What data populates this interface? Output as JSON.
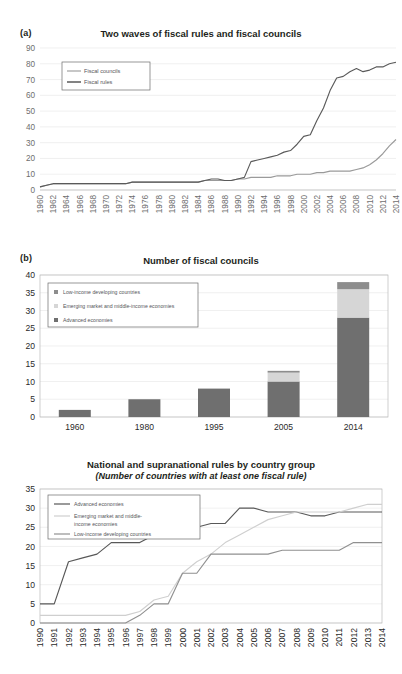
{
  "figure": {
    "panel_a_letter": "(a)",
    "panel_b_letter": "(b)"
  },
  "chart_data": [
    {
      "id": "panel_a",
      "type": "line",
      "title": "Two waves of fiscal rules and fiscal councils",
      "xlabel": "",
      "ylabel": "",
      "ylim": [
        0,
        90
      ],
      "yticks": [
        0,
        10,
        20,
        30,
        40,
        50,
        60,
        70,
        80,
        90
      ],
      "grid": true,
      "legend_position": "top-left",
      "x": [
        1960,
        1961,
        1962,
        1963,
        1964,
        1965,
        1966,
        1967,
        1968,
        1969,
        1970,
        1971,
        1972,
        1973,
        1974,
        1975,
        1976,
        1977,
        1978,
        1979,
        1980,
        1981,
        1982,
        1983,
        1984,
        1985,
        1986,
        1987,
        1988,
        1989,
        1990,
        1991,
        1992,
        1993,
        1994,
        1995,
        1996,
        1997,
        1998,
        1999,
        2000,
        2001,
        2002,
        2003,
        2004,
        2005,
        2006,
        2007,
        2008,
        2009,
        2010,
        2011,
        2012,
        2013,
        2014
      ],
      "xtick_labels": [
        "1960",
        "1962",
        "1964",
        "1966",
        "1968",
        "1970",
        "1972",
        "1974",
        "1976",
        "1978",
        "1980",
        "1982",
        "1984",
        "1986",
        "1988",
        "1990",
        "1992",
        "1994",
        "1996",
        "1998",
        "2000",
        "2002",
        "2004",
        "2006",
        "2008",
        "2010",
        "2012",
        "2014"
      ],
      "series": [
        {
          "name": "Fiscal councils",
          "color": "#9a9a9a",
          "values": [
            2,
            3,
            4,
            4,
            4,
            4,
            4,
            4,
            4,
            4,
            4,
            4,
            4,
            4,
            5,
            5,
            5,
            5,
            5,
            5,
            5,
            5,
            5,
            5,
            5,
            6,
            6,
            6,
            6,
            6,
            7,
            7,
            8,
            8,
            8,
            8,
            9,
            9,
            9,
            10,
            10,
            10,
            11,
            11,
            12,
            12,
            12,
            12,
            13,
            14,
            16,
            19,
            23,
            28,
            32
          ]
        },
        {
          "name": "Fiscal rules",
          "color": "#5a5a5a",
          "values": [
            2,
            3,
            4,
            4,
            4,
            4,
            4,
            4,
            4,
            4,
            4,
            4,
            4,
            4,
            5,
            5,
            5,
            5,
            5,
            5,
            5,
            5,
            5,
            5,
            5,
            6,
            7,
            7,
            6,
            6,
            7,
            8,
            18,
            19,
            20,
            21,
            22,
            24,
            25,
            29,
            34,
            35,
            44,
            52,
            63,
            71,
            72,
            75,
            77,
            75,
            76,
            78,
            78,
            80,
            81
          ]
        }
      ]
    },
    {
      "id": "panel_b",
      "type": "bar",
      "bar_mode": "stacked",
      "title": "Number of fiscal councils",
      "xlabel": "",
      "ylabel": "",
      "ylim": [
        0,
        40
      ],
      "yticks": [
        0,
        5,
        10,
        15,
        20,
        25,
        30,
        35,
        40
      ],
      "grid": true,
      "legend_position": "top-left",
      "categories": [
        "1960",
        "1980",
        "1995",
        "2005",
        "2014"
      ],
      "series": [
        {
          "name": "Low-income developing countries",
          "color": "#8d8d8d",
          "values": [
            0,
            0,
            0,
            0.5,
            2
          ]
        },
        {
          "name": "Emerging market and middle-income economies",
          "color": "#d6d6d6",
          "values": [
            0,
            0,
            0,
            2.5,
            8
          ]
        },
        {
          "name": "Advanced economies",
          "color": "#6f6f6f",
          "values": [
            2,
            5,
            8,
            10,
            28
          ]
        }
      ],
      "stack_order": [
        "Advanced economies",
        "Emerging market and middle-income economies",
        "Low-income developing countries"
      ]
    },
    {
      "id": "panel_c",
      "type": "line",
      "title": "National and supranational rules by country group",
      "subtitle": "(Number of countries with at least one fiscal rule)",
      "xlabel": "",
      "ylabel": "",
      "ylim": [
        0,
        35
      ],
      "yticks": [
        0,
        5,
        10,
        15,
        20,
        25,
        30,
        35
      ],
      "grid": true,
      "legend_position": "top-left",
      "x": [
        1990,
        1991,
        1992,
        1993,
        1994,
        1995,
        1996,
        1997,
        1998,
        1999,
        2000,
        2001,
        2002,
        2003,
        2004,
        2005,
        2006,
        2007,
        2008,
        2009,
        2010,
        2011,
        2012,
        2013,
        2014
      ],
      "xtick_labels": [
        "1990",
        "1991",
        "1992",
        "1993",
        "1994",
        "1995",
        "1996",
        "1997",
        "1998",
        "1999",
        "2000",
        "2001",
        "2002",
        "2003",
        "2004",
        "2005",
        "2006",
        "2007",
        "2008",
        "2009",
        "2010",
        "2011",
        "2012",
        "2013",
        "2014"
      ],
      "series": [
        {
          "name": "Advanced economies",
          "color": "#585858",
          "values": [
            5,
            5,
            16,
            17,
            18,
            21,
            21,
            21,
            23,
            23,
            24,
            25,
            26,
            26,
            30,
            30,
            29,
            29,
            29,
            28,
            28,
            29,
            29,
            29,
            29
          ]
        },
        {
          "name": "Emerging market and middle-income economies",
          "color": "#cfcfcf",
          "values": [
            2,
            2,
            2,
            2,
            2,
            2,
            2,
            3,
            6,
            7,
            13,
            16,
            18,
            21,
            23,
            25,
            27,
            28,
            29,
            29,
            29,
            29,
            30,
            31,
            31
          ]
        },
        {
          "name": "Low-income developing countries",
          "color": "#909090",
          "values": [
            0,
            0,
            0,
            0,
            0,
            0,
            0,
            2,
            5,
            5,
            13,
            13,
            18,
            18,
            18,
            18,
            18,
            19,
            19,
            19,
            19,
            19,
            21,
            21,
            21
          ]
        }
      ]
    }
  ]
}
